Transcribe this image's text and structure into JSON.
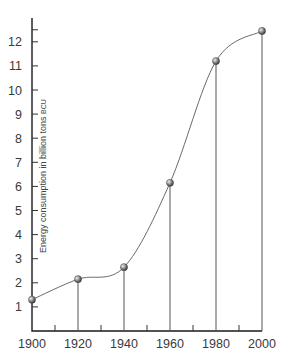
{
  "chart_data": {
    "type": "line",
    "title": "",
    "xlabel": "",
    "ylabel": "Energy consumption in billion tons BCU",
    "ylabel_main": "Energy consumption in billion tons ",
    "ylabel_unit": "BCU",
    "x": [
      1900,
      1920,
      1940,
      1960,
      1980,
      2000
    ],
    "series": [
      {
        "name": "Energy consumption",
        "values": [
          1.3,
          2.15,
          2.65,
          6.15,
          11.2,
          12.45
        ]
      }
    ],
    "xlim": [
      1900,
      2000
    ],
    "ylim": [
      0,
      13
    ],
    "x_ticks": [
      "1900",
      "1920",
      "1940",
      "1960",
      "1980",
      "2000"
    ],
    "x_minor_ticks": [
      1910,
      1930,
      1950,
      1970,
      1990
    ],
    "y_ticks": [
      "1",
      "2",
      "3",
      "4",
      "5",
      "6",
      "7",
      "8",
      "9",
      "10",
      "11",
      "12"
    ],
    "grid": false,
    "legend": null,
    "drop_lines": true,
    "markers": "sphere"
  }
}
